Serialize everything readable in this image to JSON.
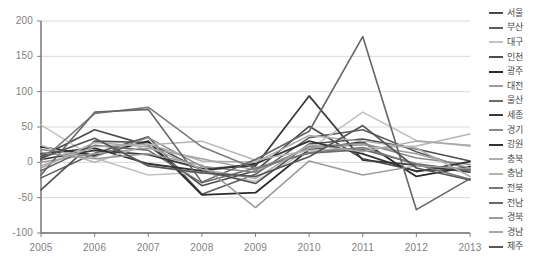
{
  "chart_data": {
    "type": "line",
    "title": "",
    "xlabel": "",
    "ylabel": "",
    "x": [
      2005,
      2006,
      2007,
      2008,
      2009,
      2010,
      2011,
      2012,
      2013
    ],
    "xticklabels": [
      "2005",
      "2006",
      "2007",
      "2008",
      "2009",
      "2010",
      "2011",
      "2012",
      "2013"
    ],
    "yticklabels": [
      "200",
      "150",
      "100",
      "50",
      "0",
      "-50",
      "-100"
    ],
    "yticks": [
      200,
      150,
      100,
      50,
      0,
      -50,
      -100
    ],
    "ylim": [
      -100,
      200
    ],
    "xlim": [
      2005,
      2013
    ],
    "grid": "horizontal",
    "legend_position": "right",
    "series": [
      {
        "name": "서울",
        "color": "#4a4a4a",
        "width": 1.6,
        "values": [
          8,
          46,
          24,
          -33,
          -12,
          51,
          5,
          -12,
          -10
        ]
      },
      {
        "name": "부산",
        "color": "#5e5e5e",
        "width": 1.6,
        "values": [
          -22,
          13,
          36,
          -45,
          -17,
          35,
          46,
          15,
          -10
        ]
      },
      {
        "name": "대구",
        "color": "#c2c2c2",
        "width": 1.6,
        "values": [
          53,
          6,
          -18,
          -14,
          -27,
          18,
          71,
          31,
          23
        ]
      },
      {
        "name": "인천",
        "color": "#4f4f4f",
        "width": 1.6,
        "values": [
          -39,
          30,
          28,
          -11,
          -30,
          26,
          33,
          19,
          2
        ]
      },
      {
        "name": "광주",
        "color": "#2b2b2b",
        "width": 1.8,
        "values": [
          22,
          10,
          30,
          -46,
          -43,
          18,
          29,
          -20,
          -6
        ]
      },
      {
        "name": "대전",
        "color": "#9e9e9e",
        "width": 1.5,
        "values": [
          0,
          12,
          20,
          5,
          -11,
          20,
          25,
          12,
          -8
        ]
      },
      {
        "name": "울산",
        "color": "#6b6b6b",
        "width": 1.6,
        "values": [
          -12,
          24,
          17,
          -29,
          -8,
          13,
          18,
          -2,
          -12
        ]
      },
      {
        "name": "세종",
        "color": "#3a3a3a",
        "width": 1.7,
        "values": [
          4,
          17,
          11,
          -9,
          -5,
          94,
          3,
          -4,
          -14
        ]
      },
      {
        "name": "경기",
        "color": "#8a8a8a",
        "width": 1.5,
        "values": [
          18,
          8,
          35,
          -6,
          -14,
          22,
          27,
          6,
          -3
        ]
      },
      {
        "name": "강원",
        "color": "#333333",
        "width": 1.8,
        "values": [
          12,
          20,
          -2,
          -12,
          -2,
          30,
          12,
          -13,
          1
        ]
      },
      {
        "name": "충북",
        "color": "#adadad",
        "width": 1.5,
        "values": [
          -5,
          22,
          26,
          2,
          0,
          38,
          30,
          20,
          -20
        ]
      },
      {
        "name": "충남",
        "color": "#b5b5b5",
        "width": 1.5,
        "values": [
          24,
          0,
          25,
          30,
          3,
          17,
          20,
          23,
          40
        ]
      },
      {
        "name": "전북",
        "color": "#7a7a7a",
        "width": 1.5,
        "values": [
          2,
          69,
          78,
          22,
          -9,
          14,
          21,
          -3,
          -24
        ]
      },
      {
        "name": "전남",
        "color": "#666666",
        "width": 1.6,
        "values": [
          -18,
          71,
          75,
          -28,
          4,
          44,
          178,
          -67,
          -23
        ]
      },
      {
        "name": "경북",
        "color": "#9a9a9a",
        "width": 1.5,
        "values": [
          14,
          5,
          12,
          -4,
          -64,
          2,
          -18,
          -5,
          -9
        ]
      },
      {
        "name": "경남",
        "color": "#a8a8a8",
        "width": 1.5,
        "values": [
          -8,
          28,
          22,
          -10,
          -23,
          25,
          15,
          30,
          24
        ]
      },
      {
        "name": "제주",
        "color": "#575757",
        "width": 1.7,
        "values": [
          6,
          34,
          -5,
          -15,
          -20,
          8,
          52,
          -8,
          -25
        ]
      }
    ]
  },
  "axis": {
    "y_ticks": [
      "200",
      "150",
      "100",
      "50",
      "0",
      "-50",
      "-100"
    ],
    "x_ticks": [
      "2005",
      "2006",
      "2007",
      "2008",
      "2009",
      "2010",
      "2011",
      "2012",
      "2013"
    ]
  },
  "legend": {
    "items": [
      {
        "label": "서울"
      },
      {
        "label": "부산"
      },
      {
        "label": "대구"
      },
      {
        "label": "인천"
      },
      {
        "label": "광주"
      },
      {
        "label": "대전"
      },
      {
        "label": "울산"
      },
      {
        "label": "세종"
      },
      {
        "label": "경기"
      },
      {
        "label": "강원"
      },
      {
        "label": "충북"
      },
      {
        "label": "충남"
      },
      {
        "label": "전북"
      },
      {
        "label": "전남"
      },
      {
        "label": "경북"
      },
      {
        "label": "경남"
      },
      {
        "label": "제주"
      }
    ]
  },
  "style": {
    "background": "#ffffff",
    "grid_color": "#d9d9d9",
    "axis_color": "#808080",
    "tick_text_color": "#808080",
    "legend_text_color": "#4a4a4a"
  }
}
